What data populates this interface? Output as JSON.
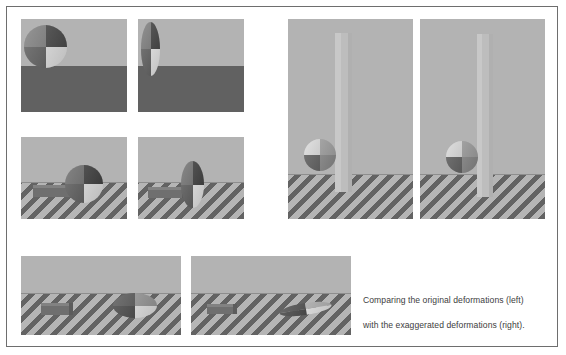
{
  "figure": {
    "caption_line1": "Comparing the original deformations (left)",
    "caption_line2": "with the exaggerated deformations (right).",
    "border_color": "#6e6e6e",
    "background_color": "#ffffff"
  },
  "palette": {
    "wall": "#b3b3b3",
    "floor_solid": "#616161",
    "hatch_dark": "#636363",
    "hatch_light": "#b5b5b5",
    "bar": "#6f6f6f",
    "column": "#bdbdbd",
    "ball_dark": "#4a4a4a",
    "ball_mid": "#8f8f8f",
    "ball_light": "#e8e8e8",
    "ball_grey": "#6d6d6d"
  },
  "panels": [
    {
      "id": "panel-1",
      "name": "sphere-original-solid-floor",
      "group": "top-left-grid",
      "row": 1,
      "col": 1,
      "floor_type": "solid",
      "object": "sphere",
      "deformation": "original",
      "description": "Undeformed sphere resting at the top of a solid dark floor"
    },
    {
      "id": "panel-2",
      "name": "sphere-exaggerated-solid-floor",
      "group": "top-left-grid",
      "row": 1,
      "col": 2,
      "floor_type": "solid",
      "object": "sphere",
      "deformation": "exaggerated",
      "description": "Vertically stretched sphere on a solid dark floor"
    },
    {
      "id": "panel-3",
      "name": "sphere-bar-original-hatched-floor",
      "group": "top-left-grid",
      "row": 2,
      "col": 1,
      "floor_type": "hatched",
      "object": "sphere-with-bar",
      "deformation": "original",
      "description": "Sphere and horizontal bar on a hatched floor"
    },
    {
      "id": "panel-4",
      "name": "sphere-bar-exaggerated-hatched-floor",
      "group": "top-left-grid",
      "row": 2,
      "col": 2,
      "floor_type": "hatched",
      "object": "sphere-with-bar",
      "deformation": "exaggerated",
      "description": "Vertically stretched sphere and bar on a hatched floor"
    },
    {
      "id": "panel-5",
      "name": "column-sphere-original",
      "group": "right-column",
      "row": 1,
      "col": 1,
      "floor_type": "hatched",
      "object": "column-with-sphere",
      "deformation": "original",
      "description": "Tall vertical column with a sphere at its base on a hatched floor"
    },
    {
      "id": "panel-6",
      "name": "column-sphere-exaggerated",
      "group": "right-column",
      "row": 1,
      "col": 2,
      "floor_type": "hatched",
      "object": "column-with-sphere",
      "deformation": "exaggerated",
      "description": "Tall vertical column with a rotated sphere at its base on a hatched floor"
    },
    {
      "id": "panel-7",
      "name": "flattened-sphere-original",
      "group": "bottom-row",
      "row": 1,
      "col": 1,
      "floor_type": "hatched",
      "object": "flattened-sphere-with-bar",
      "deformation": "original",
      "description": "Horizontally flattened sphere with a bar to the left on a hatched floor"
    },
    {
      "id": "panel-8",
      "name": "flattened-sphere-exaggerated",
      "group": "bottom-row",
      "row": 1,
      "col": 2,
      "floor_type": "hatched",
      "object": "sliver-sphere-with-bar",
      "deformation": "exaggerated",
      "description": "Extremely flattened sliver-like sphere with a bar to the left on a hatched floor"
    }
  ]
}
